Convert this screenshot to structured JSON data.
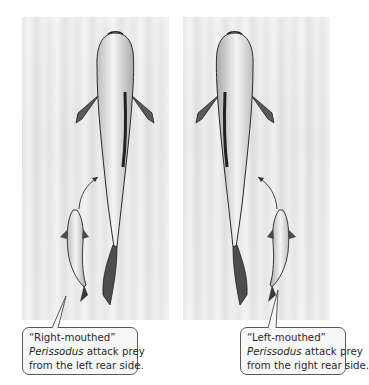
{
  "figure": {
    "left_panel": {
      "description": "Right-mouthed Perissodus (small fish) approaching large prey fish from the left rear side",
      "callout": {
        "line1": "“Right-mouthed”",
        "genus": "Perissodus",
        "line2_rest": " attack prey",
        "line3": "from the left rear side."
      }
    },
    "right_panel": {
      "description": "Left-mouthed Perissodus (small fish) approaching large prey fish from the right rear side",
      "callout": {
        "line1": "“Left-mouthed”",
        "genus": "Perissodus",
        "line2_rest": " attack prey",
        "line3": "from the right rear side."
      }
    },
    "icons": [
      "prey-fish-icon",
      "predator-fish-icon",
      "attack-arrow-icon"
    ],
    "colors": {
      "water_background": "#e6e6e6",
      "fish_body": "#d8d8d8",
      "fish_outline": "#2a2a2a",
      "callout_border": "#5a5a5a",
      "text": "#2a2a2a"
    }
  }
}
